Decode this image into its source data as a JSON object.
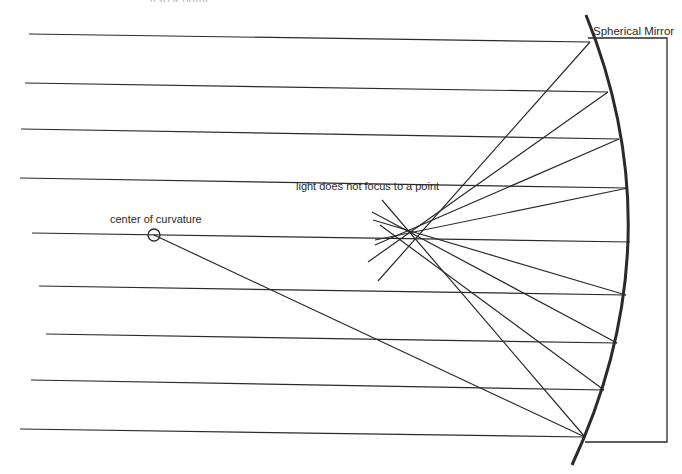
{
  "diagram": {
    "type": "ray-optics",
    "title_partial": "...g to a point",
    "labels": {
      "mirror": "Spherical Mirror",
      "center": "center of curvature",
      "aberration": "light does not focus to a point"
    },
    "colors": {
      "ink": "#2a2a2a",
      "background": "#ffffff"
    },
    "mirror_arc": {
      "top": [
        586,
        15
      ],
      "mid": [
        628,
        240
      ],
      "bottom": [
        572,
        465
      ]
    },
    "label_box": {
      "x1": 588,
      "y1": 38,
      "x2": 667,
      "y2": 442
    },
    "center_of_curvature": {
      "x": 154,
      "y": 235,
      "r": 6
    },
    "incoming_rays": [
      {
        "x1": 29,
        "y1": 34,
        "x2": 590,
        "y2": 42
      },
      {
        "x1": 25,
        "y1": 83,
        "x2": 608,
        "y2": 92
      },
      {
        "x1": 21,
        "y1": 129,
        "x2": 619,
        "y2": 139
      },
      {
        "x1": 20,
        "y1": 178,
        "x2": 628,
        "y2": 188
      },
      {
        "x1": 32,
        "y1": 233,
        "x2": 630,
        "y2": 242
      },
      {
        "x1": 39,
        "y1": 286,
        "x2": 626,
        "y2": 295
      },
      {
        "x1": 46,
        "y1": 334,
        "x2": 617,
        "y2": 343
      },
      {
        "x1": 31,
        "y1": 380,
        "x2": 604,
        "y2": 390
      },
      {
        "x1": 20,
        "y1": 429,
        "x2": 585,
        "y2": 437
      }
    ],
    "reflected_rays": [
      {
        "x1": 590,
        "y1": 42,
        "x2": 378,
        "y2": 281
      },
      {
        "x1": 608,
        "y1": 92,
        "x2": 368,
        "y2": 262
      },
      {
        "x1": 619,
        "y1": 139,
        "x2": 375,
        "y2": 245
      },
      {
        "x1": 628,
        "y1": 188,
        "x2": 375,
        "y2": 240
      },
      {
        "x1": 626,
        "y1": 295,
        "x2": 373,
        "y2": 220
      },
      {
        "x1": 617,
        "y1": 343,
        "x2": 372,
        "y2": 212
      },
      {
        "x1": 604,
        "y1": 390,
        "x2": 380,
        "y2": 225
      },
      {
        "x1": 585,
        "y1": 437,
        "x2": 382,
        "y2": 200
      },
      {
        "x1": 585,
        "y1": 437,
        "x2": 154,
        "y2": 235
      }
    ]
  }
}
